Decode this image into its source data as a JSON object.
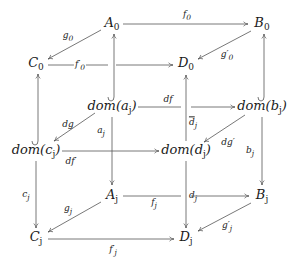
{
  "diagram": {
    "type": "commutative-cube",
    "stroke_color": "#555555",
    "nodes": [
      {
        "id": "A0",
        "label": "A",
        "sub": "0",
        "x": 112,
        "y": 24
      },
      {
        "id": "B0",
        "label": "B",
        "sub": "0",
        "x": 262,
        "y": 24
      },
      {
        "id": "C0",
        "label": "C",
        "sub": "0",
        "x": 36,
        "y": 64
      },
      {
        "id": "D0",
        "label": "D",
        "sub": "0",
        "x": 186,
        "y": 64
      },
      {
        "id": "domaj",
        "label": "dom(a",
        "sub": "j",
        "suffix": ")",
        "x": 112,
        "y": 107
      },
      {
        "id": "dombj",
        "label": "dom(b",
        "sub": "j",
        "suffix": ")",
        "x": 262,
        "y": 107
      },
      {
        "id": "domcj",
        "label": "dom(c",
        "sub": "j",
        "suffix": ")",
        "x": 36,
        "y": 151
      },
      {
        "id": "domdj",
        "label": "dom(d",
        "sub": "j",
        "suffix": ")",
        "x": 186,
        "y": 151
      },
      {
        "id": "Aj",
        "label": "A",
        "sub": "j",
        "x": 112,
        "y": 196
      },
      {
        "id": "Bj",
        "label": "B",
        "sub": "j",
        "x": 262,
        "y": 196
      },
      {
        "id": "Cj",
        "label": "C",
        "sub": "j",
        "x": 36,
        "y": 238
      },
      {
        "id": "Dj",
        "label": "D",
        "sub": "j",
        "x": 186,
        "y": 238
      }
    ],
    "edge_labels": [
      {
        "id": "f0",
        "text": "f",
        "sub": "0",
        "x": 187,
        "y": 16
      },
      {
        "id": "g0",
        "text": "g",
        "sub": "0",
        "x": 68,
        "y": 37
      },
      {
        "id": "f0p",
        "text": "f′",
        "sub": "0",
        "x": 80,
        "y": 66
      },
      {
        "id": "g0p",
        "text": "g′",
        "sub": "0",
        "x": 227,
        "y": 56
      },
      {
        "id": "df",
        "text": "df",
        "sub": "",
        "x": 168,
        "y": 99
      },
      {
        "id": "dg",
        "text": "dg",
        "sub": "",
        "x": 68,
        "y": 124
      },
      {
        "id": "aj",
        "text": "a",
        "sub": "j",
        "x": 101,
        "y": 132
      },
      {
        "id": "djbar",
        "text": "d",
        "sub": "j",
        "overline": true,
        "x": 191,
        "y": 124
      },
      {
        "id": "dgp",
        "text": "dg′",
        "sub": "",
        "x": 228,
        "y": 142
      },
      {
        "id": "dfp",
        "text": "df′",
        "sub": "",
        "x": 71,
        "y": 161
      },
      {
        "id": "bj",
        "text": "b",
        "sub": "j",
        "x": 250,
        "y": 152
      },
      {
        "id": "cj",
        "text": "c",
        "sub": "j",
        "x": 26,
        "y": 196
      },
      {
        "id": "dj",
        "text": "d",
        "sub": "j",
        "x": 191,
        "y": 197
      },
      {
        "id": "gj",
        "text": "g",
        "sub": "j",
        "x": 68,
        "y": 210
      },
      {
        "id": "fj",
        "text": "f",
        "sub": "j",
        "x": 154,
        "y": 204
      },
      {
        "id": "gjp",
        "text": "g′",
        "sub": "j",
        "x": 227,
        "y": 227
      },
      {
        "id": "fjp",
        "text": "f′",
        "sub": "j",
        "x": 113,
        "y": 251
      }
    ]
  }
}
